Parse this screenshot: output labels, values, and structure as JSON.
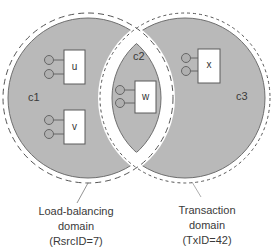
{
  "diagram": {
    "type": "venn-domains",
    "colors": {
      "region_fill": "#b9b9b9",
      "region_stroke": "#6e6e6e",
      "domain_stroke": "#555555",
      "box_fill": "#ffffff",
      "box_stroke": "#5a5a5a",
      "text": "#3a3a3a"
    },
    "regions": [
      {
        "id": "c1",
        "label": "c1"
      },
      {
        "id": "c2",
        "label": "c2"
      },
      {
        "id": "c3",
        "label": "c3"
      }
    ],
    "nodes": [
      {
        "id": "u",
        "label": "u",
        "region": "c1",
        "ports": 2
      },
      {
        "id": "v",
        "label": "v",
        "region": "c1",
        "ports": 2
      },
      {
        "id": "w",
        "label": "w",
        "region": "c2",
        "ports": 2
      },
      {
        "id": "x",
        "label": "x",
        "region": "c3",
        "ports": 2
      }
    ],
    "domains": [
      {
        "id": "load-balancing",
        "line1": "Load-balancing",
        "line2": "domain",
        "line3": "(RsrcID=7)",
        "border": "long-dashed"
      },
      {
        "id": "transaction",
        "line1": "Transaction",
        "line2": "domain",
        "line3": "(TxID=42)",
        "border": "short-dashed"
      }
    ]
  }
}
